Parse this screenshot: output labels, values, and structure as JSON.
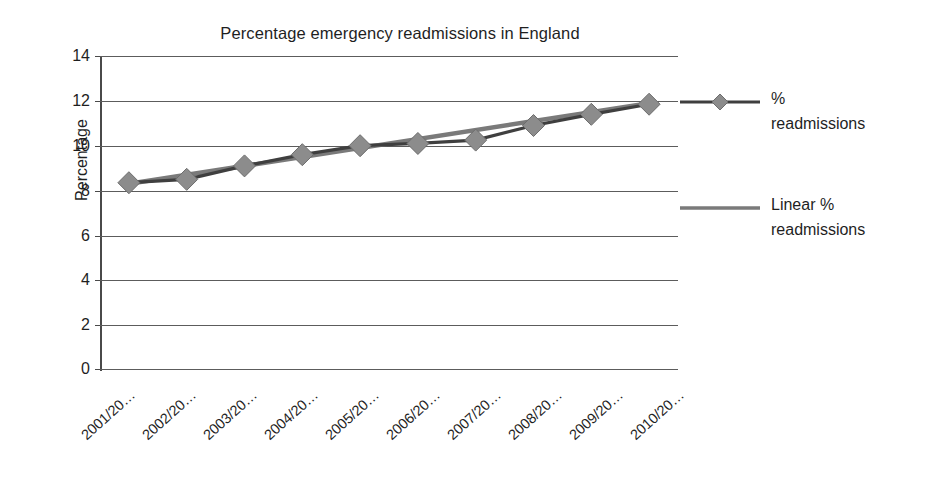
{
  "chart_data": {
    "type": "line",
    "title": "Percentage emergency readmissions in England",
    "xlabel": "",
    "ylabel": "Percentage",
    "ylim": [
      0,
      14
    ],
    "ytick_step": 2,
    "yticks": [
      "14",
      "12",
      "10",
      "8",
      "6",
      "4",
      "2",
      "0"
    ],
    "grid": true,
    "legend_position": "right",
    "categories": [
      "2001/20…",
      "2002/20…",
      "2003/20…",
      "2004/20…",
      "2005/20…",
      "2006/20…",
      "2007/20…",
      "2008/20…",
      "2009/20…",
      "2010/20…"
    ],
    "series": [
      {
        "name": "% readmissions",
        "marker": "diamond",
        "values": [
          8.35,
          8.5,
          9.1,
          9.6,
          10.0,
          10.1,
          10.25,
          10.9,
          11.4,
          11.85
        ]
      },
      {
        "name": "Linear % readmissions",
        "marker": "none",
        "trendline": true,
        "values": [
          8.3,
          8.7,
          9.1,
          9.5,
          9.9,
          10.3,
          10.7,
          11.1,
          11.5,
          11.9
        ]
      }
    ],
    "colors": {
      "series_line": "#4a4a4a",
      "series_marker": "#8c8c8c",
      "trendline": "#7a7a7a",
      "gridline": "#5c5c5c",
      "axis": "#4a4a4a",
      "text": "#1f1f1f",
      "background": "#ffffff"
    }
  },
  "legend": {
    "items": [
      {
        "label_line_1": "%",
        "label_line_2": "readmissions",
        "swatch": "line-with-diamond-marker"
      },
      {
        "label_line_1": "Linear  %",
        "label_line_2": "readmissions",
        "swatch": "plain-line"
      }
    ]
  }
}
